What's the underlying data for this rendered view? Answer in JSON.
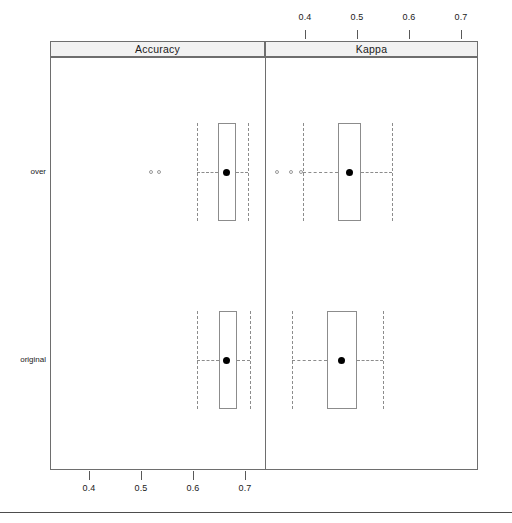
{
  "figure": {
    "row_labels": [
      "over",
      "original"
    ],
    "panels": [
      {
        "name": "accuracy",
        "title": "Accuracy"
      },
      {
        "name": "kappa",
        "title": "Kappa"
      }
    ],
    "axis_top": {
      "ticks": [
        "0.4",
        "0.5",
        "0.6",
        "0.7"
      ]
    },
    "axis_bottom": {
      "ticks": [
        "0.4",
        "0.5",
        "0.6",
        "0.7"
      ]
    }
  },
  "chart_data": {
    "type": "box",
    "title": "",
    "subtitle": "",
    "xlabel": "",
    "ylabel": "",
    "orientation": "horizontal",
    "grid": false,
    "legend": "none",
    "panel_variable": "metric",
    "group_variable": "resampling",
    "panels": [
      {
        "label": "Accuracy",
        "axis_position": "bottom",
        "axis_ticks": [
          0.4,
          0.5,
          0.6,
          0.7
        ],
        "xlim": [
          0.345,
          0.758
        ],
        "boxes": [
          {
            "group": "over",
            "min": 0.608,
            "q1": 0.648,
            "median": 0.664,
            "q3": 0.683,
            "max": 0.706,
            "outliers": [
              0.519,
              0.535
            ]
          },
          {
            "group": "original",
            "min": 0.608,
            "q1": 0.65,
            "median": 0.665,
            "q3": 0.685,
            "max": 0.71,
            "outliers": []
          }
        ]
      },
      {
        "label": "Kappa",
        "axis_position": "top",
        "axis_ticks": [
          0.4,
          0.5,
          0.6,
          0.7
        ],
        "xlim": [
          0.317,
          0.727
        ],
        "boxes": [
          {
            "group": "over",
            "min": 0.396,
            "q1": 0.463,
            "median": 0.485,
            "q3": 0.508,
            "max": 0.567,
            "outliers": [
              0.346,
              0.373,
              0.392
            ]
          },
          {
            "group": "original",
            "min": 0.375,
            "q1": 0.442,
            "median": 0.471,
            "q3": 0.5,
            "max": 0.55,
            "outliers": []
          }
        ]
      }
    ]
  },
  "geometry": {
    "plot_left": 50,
    "plot_right": 478,
    "panel_divider_x": 265,
    "strip_top": 41,
    "strip_bottom": 57,
    "plot_bottom": 470,
    "row_y": [
      172,
      360
    ],
    "accuracy_scale": {
      "origin_px": 89,
      "origin_val": 0.4,
      "px_per_unit": 520
    },
    "kappa_scale": {
      "origin_px": 305,
      "origin_val": 0.4,
      "px_per_unit": 520
    },
    "bottom_rule_y": 512
  }
}
